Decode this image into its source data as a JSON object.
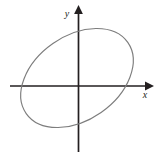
{
  "figure": {
    "background_color": "#ffffff",
    "width": 165,
    "height": 158,
    "axis_color": "#231f20",
    "curve_color": "#7d7d7d"
  },
  "axes": {
    "x_axis": {
      "label": "x",
      "label_x": 145,
      "label_y": 98,
      "font_size": 10,
      "start_x": 10,
      "end_x": 145,
      "y": 86,
      "arrow_direction": "right"
    },
    "y_axis": {
      "label": "y",
      "label_x": 67,
      "label_y": 17,
      "font_size": 10,
      "x": 78,
      "start_y": 152,
      "end_y": 12,
      "arrow_direction": "up"
    },
    "origin": {
      "x": 78,
      "y": 86
    }
  },
  "chart_data": {
    "type": "line",
    "xlabel": "x",
    "ylabel": "y",
    "xlim": [
      -78,
      87
    ],
    "ylim": [
      -72,
      86
    ],
    "grid": false,
    "legend": false,
    "curve": {
      "name": "ellipse",
      "shape": "ellipse",
      "center_px": {
        "x": 77,
        "y": 78
      },
      "center_data": {
        "x": -1,
        "y": 8
      },
      "semi_major_axis_px": 62,
      "semi_minor_axis_px": 42,
      "rotation_degrees": -35,
      "stroke_color": "#7d7d7d",
      "stroke_width": 1.15,
      "filled": false,
      "extremes_px": {
        "topmost": {
          "x": 90,
          "y": 23
        },
        "bottommost": {
          "x": 65,
          "y": 133
        },
        "leftmost": {
          "x": 32,
          "y": 87
        },
        "rightmost": {
          "x": 122,
          "y": 68
        }
      },
      "x_axis_intercepts_px": [
        {
          "x": 33,
          "y": 86
        },
        {
          "x": 118,
          "y": 86
        }
      ],
      "y_axis_intercepts_px": [
        {
          "x": 78,
          "y": 24
        },
        {
          "x": 78,
          "y": 132
        }
      ]
    }
  }
}
